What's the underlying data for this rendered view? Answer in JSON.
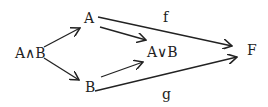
{
  "diagram": {
    "nodes": {
      "a_and_b": "A∧B",
      "a": "A",
      "b": "B",
      "a_or_b": "A∨B",
      "f_target": "F"
    },
    "edge_labels": {
      "f": "f",
      "g": "g"
    },
    "edges": [
      {
        "from": "A∧B",
        "to": "A"
      },
      {
        "from": "A∧B",
        "to": "B"
      },
      {
        "from": "A",
        "to": "A∨B"
      },
      {
        "from": "B",
        "to": "A∨B"
      },
      {
        "from": "A",
        "to": "F",
        "label": "f"
      },
      {
        "from": "B",
        "to": "F",
        "label": "g"
      }
    ]
  }
}
